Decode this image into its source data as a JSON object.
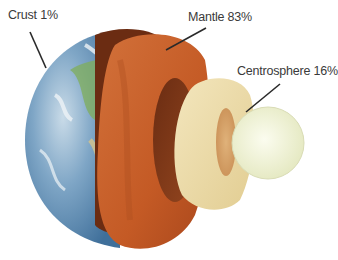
{
  "diagram": {
    "labels": [
      {
        "id": "crust",
        "text": "Crust 1%"
      },
      {
        "id": "mantle",
        "text": "Mantle 83%"
      },
      {
        "id": "centrosphere",
        "text": "Centrosphere 16%"
      }
    ],
    "colors": {
      "ocean": "#5f8fb8",
      "land": "#6aa84f",
      "cloud": "#e8eef2",
      "mantle_outer": "#c8602a",
      "mantle_inner": "#8a3f1c",
      "mantle_dark": "#5a2410",
      "centro_outer": "#eedfae",
      "centro_inner": "#d9a46a",
      "inner_core": "#f3f4dc",
      "leader": "#2a2a2a",
      "text": "#3a3a3a"
    }
  }
}
